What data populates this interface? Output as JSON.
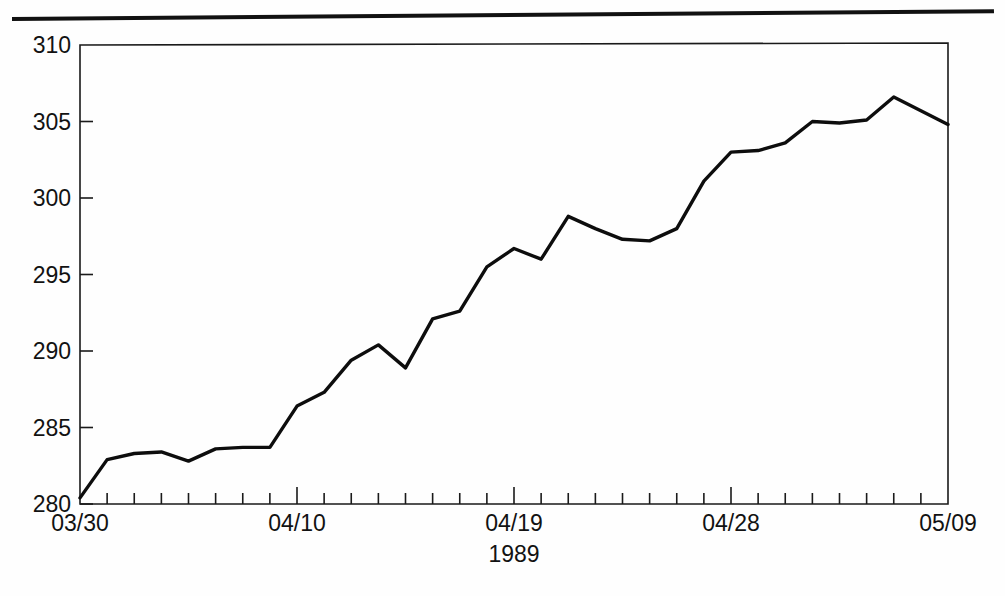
{
  "figure": {
    "background_color": "#ffffff",
    "ink_color": "#111111",
    "top_rule": "horizontal-rule"
  },
  "chart_data": {
    "type": "line",
    "title": "",
    "subtitle": "",
    "xlabel": "1989",
    "ylabel": "",
    "grid": false,
    "legend": null,
    "ylim": [
      280,
      310
    ],
    "y_ticks": [
      280,
      285,
      290,
      295,
      300,
      305,
      310
    ],
    "y_tick_labels": [
      "280",
      "285",
      "290",
      "295",
      "300",
      "305",
      "310"
    ],
    "x_major_tick_labels": [
      "03/30",
      "04/10",
      "04/19",
      "04/28",
      "05/09"
    ],
    "x_major_tick_index": [
      0,
      8,
      16,
      24,
      32
    ],
    "x_minor_ticks_per_major": 8,
    "x_total_intervals": 32,
    "x": [
      "03/30",
      "03/31",
      "04/03",
      "04/04",
      "04/05",
      "04/06",
      "04/07",
      "04/09",
      "04/10",
      "04/11",
      "04/12",
      "04/13",
      "04/14",
      "04/15",
      "04/17",
      "04/18",
      "04/19",
      "04/20",
      "04/21",
      "04/22",
      "04/24",
      "04/25",
      "04/26",
      "04/27",
      "04/28",
      "05/01",
      "05/02",
      "05/03",
      "05/04",
      "05/05",
      "05/06",
      "05/08",
      "05/09"
    ],
    "values": [
      280.4,
      282.9,
      283.3,
      283.4,
      282.8,
      283.6,
      283.7,
      283.7,
      286.4,
      287.3,
      289.4,
      290.4,
      288.9,
      292.1,
      292.6,
      295.5,
      296.7,
      296.0,
      298.8,
      298.0,
      297.3,
      297.2,
      298.0,
      301.1,
      303.0,
      303.1,
      303.6,
      305.0,
      304.9,
      305.1,
      306.6,
      305.7,
      304.8
    ],
    "series": [
      {
        "name": "index",
        "values": [
          280.4,
          282.9,
          283.3,
          283.4,
          282.8,
          283.6,
          283.7,
          283.7,
          286.4,
          287.3,
          289.4,
          290.4,
          288.9,
          292.1,
          292.6,
          295.5,
          296.7,
          296.0,
          298.8,
          298.0,
          297.3,
          297.2,
          298.0,
          301.1,
          303.0,
          303.1,
          303.6,
          305.0,
          304.9,
          305.1,
          306.6,
          305.7,
          304.8
        ],
        "color": "#0d0d0d",
        "line_width": 3.4
      }
    ]
  },
  "geometry": {
    "plot_left": 80,
    "plot_right": 948,
    "plot_top": 43,
    "plot_bottom": 504
  }
}
